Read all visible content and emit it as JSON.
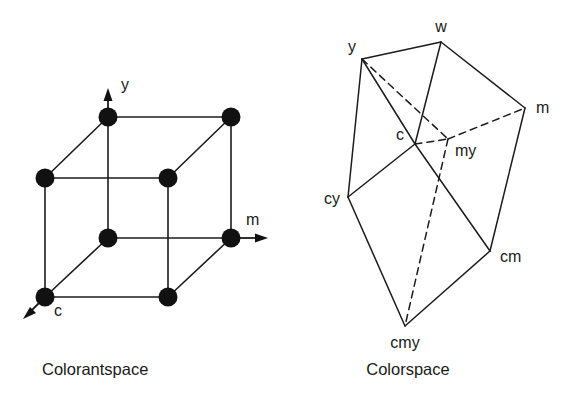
{
  "figure": {
    "background_color": "#ffffff",
    "ink_color": "#1a1a1a"
  },
  "panels": [
    {
      "id": "colorantspace",
      "caption": "Colorantspace",
      "kind": "cube-lattice",
      "axes": [
        {
          "name": "y",
          "label": "y",
          "direction": "up"
        },
        {
          "name": "m",
          "label": "m",
          "direction": "right"
        },
        {
          "name": "c",
          "label": "c",
          "direction": "down-left"
        }
      ],
      "node_count": 8,
      "nodes": [
        {
          "id": "n-top-left",
          "label": "",
          "x": 108,
          "y": 117
        },
        {
          "id": "n-top-right",
          "label": "",
          "x": 231,
          "y": 117
        },
        {
          "id": "n-mid-left",
          "label": "",
          "x": 45,
          "y": 178
        },
        {
          "id": "n-mid-inner",
          "label": "",
          "x": 168,
          "y": 178
        },
        {
          "id": "n-low-inner",
          "label": "",
          "x": 108,
          "y": 238
        },
        {
          "id": "n-low-right",
          "label": "",
          "x": 231,
          "y": 238
        },
        {
          "id": "n-bottom-left",
          "label": "c",
          "x": 45,
          "y": 297
        },
        {
          "id": "n-bottom-mid",
          "label": "",
          "x": 168,
          "y": 297
        }
      ]
    },
    {
      "id": "colorspace",
      "caption": "Colorspace",
      "kind": "distorted-cube",
      "node_count": 8,
      "nodes": [
        {
          "id": "w",
          "label": "w",
          "x": 441,
          "y": 42,
          "hidden": false
        },
        {
          "id": "y",
          "label": "y",
          "x": 362,
          "y": 59,
          "hidden": false
        },
        {
          "id": "m",
          "label": "m",
          "x": 525,
          "y": 108,
          "hidden": false
        },
        {
          "id": "c",
          "label": "c",
          "x": 415,
          "y": 144,
          "hidden": false
        },
        {
          "id": "my",
          "label": "my",
          "x": 448,
          "y": 139,
          "hidden": true
        },
        {
          "id": "cy",
          "label": "cy",
          "x": 348,
          "y": 197,
          "hidden": false
        },
        {
          "id": "cm",
          "label": "cm",
          "x": 490,
          "y": 251,
          "hidden": false
        },
        {
          "id": "cmy",
          "label": "cmy",
          "x": 405,
          "y": 326,
          "hidden": false
        }
      ],
      "edges_solid": [
        [
          "y",
          "w"
        ],
        [
          "w",
          "m"
        ],
        [
          "y",
          "c"
        ],
        [
          "w",
          "c"
        ],
        [
          "y",
          "cy"
        ],
        [
          "c",
          "cy"
        ],
        [
          "m",
          "cm"
        ],
        [
          "c",
          "cm"
        ],
        [
          "cy",
          "cmy"
        ],
        [
          "cm",
          "cmy"
        ]
      ],
      "edges_dashed": [
        [
          "y",
          "my"
        ],
        [
          "my",
          "m"
        ],
        [
          "c",
          "my"
        ],
        [
          "my",
          "cmy"
        ]
      ]
    }
  ]
}
